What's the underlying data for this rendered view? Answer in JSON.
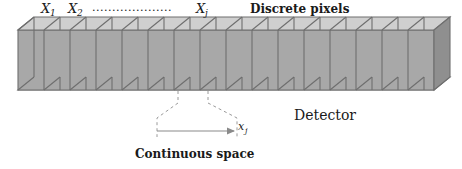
{
  "figure": {
    "type": "diagram",
    "width": 462,
    "height": 169,
    "background": "#ffffff"
  },
  "labels": {
    "x1": "X",
    "x1_sub": "1",
    "x2": "X",
    "x2_sub": "2",
    "xj": "X",
    "xj_sub": "j",
    "ellipsis": "....................",
    "discrete_pixels": "Discrete pixels",
    "detector": "Detector",
    "continuous_space": "Continuous space",
    "xj_axis": "x",
    "xj_axis_sub": "j"
  },
  "colors": {
    "top_face": "#cfcfcf",
    "front_face": "#a8a8a8",
    "bottom_face": "#d9d9d9",
    "right_cap": "#8f8f8f",
    "edge": "#6e6e6e",
    "text": "#1a1a1a",
    "dashed_guide": "#9a9a9a",
    "arrow": "#8a8a8a"
  },
  "geometry": {
    "cell_count": 16,
    "cell_width": 26,
    "box_left": 18,
    "box_right": 450,
    "depth_dx": 16,
    "depth_dy": -13,
    "front_top_y": 30,
    "front_bottom_y": 90,
    "highlight_cell_index": 6
  },
  "annotations": {
    "pixel_indices": [
      "1",
      "2",
      "j"
    ],
    "measure_start_x": 157,
    "measure_end_x": 237,
    "measure_y": 131
  }
}
